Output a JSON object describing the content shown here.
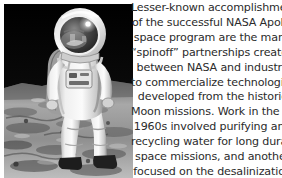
{
  "figure": {
    "photo": {
      "alt_name": "apollo-astronaut-on-moon-photo",
      "description": "Black and white photograph of an Apollo astronaut in a white spacesuit standing on the lunar surface, visor reflecting the lunar module and photographer",
      "palette": {
        "sky": "#0a0a0a",
        "regolith_light": "#cfcfcf",
        "regolith_mid": "#8a8a8a",
        "regolith_dark": "#3a3a3a",
        "suit_white": "#f2f2f2",
        "suit_shadow": "#9a9a9a",
        "visor_gold": "#4a4a4a",
        "visor_highlight": "#ffffff"
      }
    }
  },
  "caption": {
    "text_color": "#2b2b2b",
    "alignment": "center",
    "full_text": "Lesser-known accomplishments of the successful NASA Apollo space program are the many “spinoff” partnerships created between NASA and industry to commercialize technologies developed from the historic Moon missions. Work in the late 1960s involved purifying and recycling water for long duration space missions, and another focused on the desalinization",
    "lines": [
      "Lesser-known accomplishments",
      "of the successful NASA Apollo",
      "space program are the many",
      "“spinoff” partnerships created",
      "between NASA and industry",
      "to commercialize technologies",
      "developed from the historic",
      "Moon missions. Work in the late",
      "1960s involved purifying and",
      "recycling water for long duration",
      "space missions, and another",
      "focused on the desalinization"
    ]
  }
}
